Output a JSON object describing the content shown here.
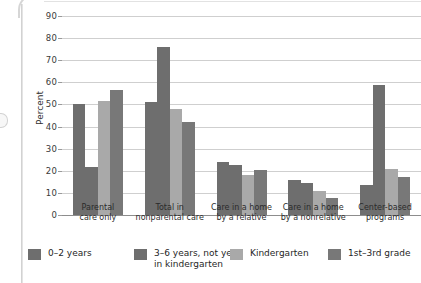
{
  "chart_data": {
    "type": "bar",
    "title": "",
    "xlabel": "",
    "ylabel": "Percent",
    "ylim": [
      0,
      90
    ],
    "ytick_step": 10,
    "yticks": [
      0,
      10,
      20,
      30,
      40,
      50,
      60,
      70,
      80,
      90
    ],
    "grid": true,
    "legend_position": "bottom",
    "categories": [
      "Parental\ncare only",
      "Total in\nnonparental care",
      "Care in a home\nby a relative",
      "Care in a home\nby a nonrelative",
      "Center-based\nprograms"
    ],
    "series": [
      {
        "name": "0–2 years",
        "color": "#6e6e6e",
        "values": [
          50,
          51,
          24,
          16,
          13.5
        ]
      },
      {
        "name": "3–6 years, not yet\nin kindergarten",
        "color": "#6e6e6e",
        "values": [
          21.5,
          76,
          22.5,
          14.5,
          59
        ]
      },
      {
        "name": "Kindergarten",
        "color": "#a9a9a9",
        "values": [
          51.5,
          48,
          18,
          11,
          21
        ]
      },
      {
        "name": "1st–3rd grade",
        "color": "#787878",
        "values": [
          56.5,
          42,
          20.5,
          7.5,
          17
        ]
      }
    ]
  },
  "axis": {
    "y_title": "Percent"
  }
}
